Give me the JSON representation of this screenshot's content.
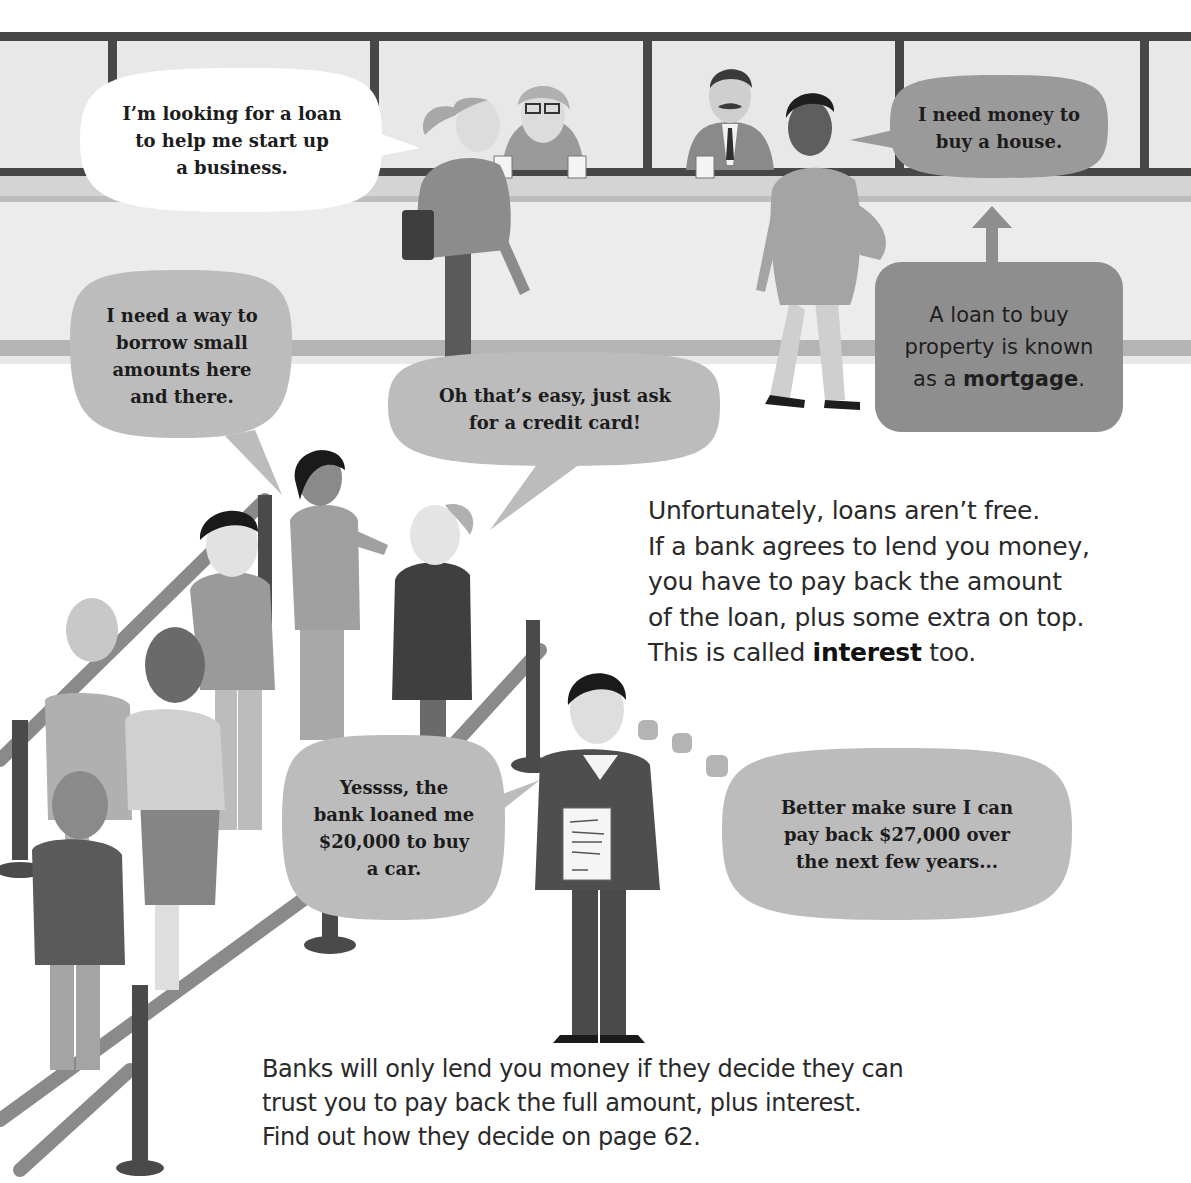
{
  "page": {
    "palette": {
      "background": "#ffffff",
      "wall": "#e9e9e9",
      "frame": "#454545",
      "bubble_light": "#bdbdbd",
      "bubble_mid": "#9a9a9a",
      "bubble_white": "#ffffff",
      "rope": "#8a8a8a",
      "post": "#4a4a4a"
    }
  },
  "bubbles": {
    "business": {
      "text": "I’m looking for a loan\nto help me start up\na business."
    },
    "house": {
      "text": "I need money to\nbuy a house."
    },
    "borrow_small": {
      "text": "I need a way to\nborrow small\namounts here\nand there."
    },
    "credit_card": {
      "text": "Oh that’s easy, just ask\nfor a credit card!"
    },
    "car_loan": {
      "text": "Yessss, the\nbank loaned me\n$20,000 to buy\na car."
    },
    "thought": {
      "text": "Better make sure I can\npay back $27,000 over\nthe next few years..."
    }
  },
  "callout": {
    "mortgage_prefix": "A loan to buy\nproperty is known\nas a ",
    "mortgage_term": "mortgage",
    "mortgage_suffix": "."
  },
  "body_text": {
    "interest_prefix": "Unfortunately, loans aren’t free.\nIf a bank agrees to lend you money,\nyou have to pay back the amount\nof the loan, plus some extra on top.\nThis is called ",
    "interest_term": "interest",
    "interest_suffix": " too.",
    "trust": "Banks will only lend you money if they decide they can\ntrust you to pay back the full amount, plus interest.\nFind out how they decide on page 62."
  }
}
